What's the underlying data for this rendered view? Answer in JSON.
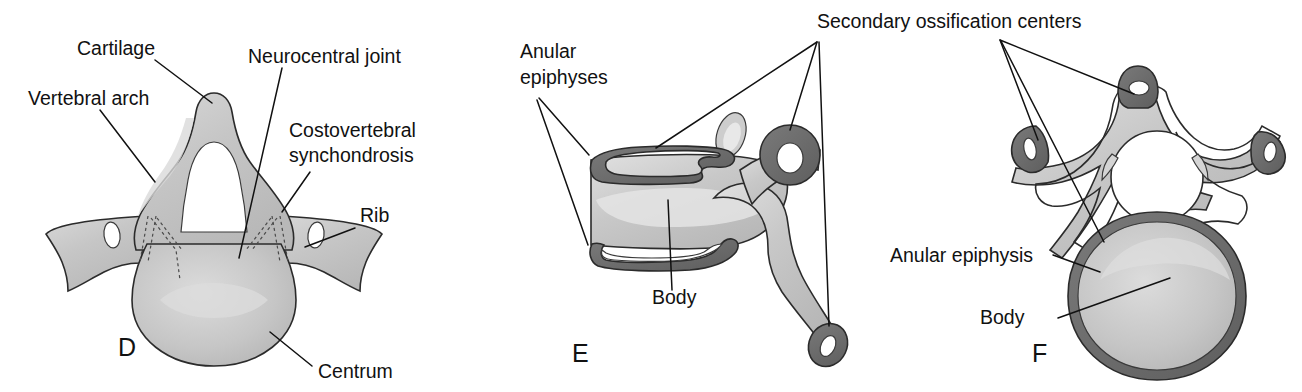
{
  "figure": {
    "background_color": "#ffffff",
    "colors": {
      "cartilage_fill": "#c9c9c9",
      "bone_fill": "#c2c2c2",
      "ossification_dark": "#6e6e6e",
      "outline": "#2b2b2b",
      "text": "#111111",
      "highlight": "#e8e8e8"
    }
  },
  "panels": [
    {
      "letter": "D",
      "name": "panel-d-thoracic-vertebra-cartilage",
      "labels": [
        {
          "text": "Cartilage",
          "name": "label-cartilage"
        },
        {
          "text": "Vertebral arch",
          "name": "label-vertebral-arch"
        },
        {
          "text": "Neurocentral joint",
          "name": "label-neurocentral-joint"
        },
        {
          "text": "Costovertebral",
          "name": "label-costovertebral-line1"
        },
        {
          "text": "synchondrosis",
          "name": "label-costovertebral-line2"
        },
        {
          "text": "Rib",
          "name": "label-rib"
        },
        {
          "text": "Centrum",
          "name": "label-centrum"
        }
      ]
    },
    {
      "letter": "E",
      "name": "panel-e-lateral-vertebra-epiphyses",
      "labels": [
        {
          "text": "Anular",
          "name": "label-anular-epiphyses-line1"
        },
        {
          "text": "epiphyses",
          "name": "label-anular-epiphyses-line2"
        },
        {
          "text": "Body",
          "name": "label-body-e"
        }
      ]
    },
    {
      "letter": "F",
      "name": "panel-f-superior-vertebra-epiphysis",
      "labels": [
        {
          "text": "Anular epiphysis",
          "name": "label-anular-epiphysis"
        },
        {
          "text": "Body",
          "name": "label-body-f"
        }
      ]
    }
  ],
  "shared_labels": [
    {
      "text": "Secondary ossification centers",
      "name": "label-secondary-ossification-centers"
    }
  ],
  "text": {
    "cartilage": "Cartilage",
    "vertebral_arch": "Vertebral arch",
    "neurocentral_joint": "Neurocentral joint",
    "costovertebral_1": "Costovertebral",
    "costovertebral_2": "synchondrosis",
    "rib": "Rib",
    "centrum": "Centrum",
    "anular_1": "Anular",
    "anular_2": "epiphyses",
    "body_e": "Body",
    "secondary": "Secondary ossification centers",
    "anular_epiphysis": "Anular epiphysis",
    "body_f": "Body",
    "letter_d": "D",
    "letter_e": "E",
    "letter_f": "F"
  }
}
